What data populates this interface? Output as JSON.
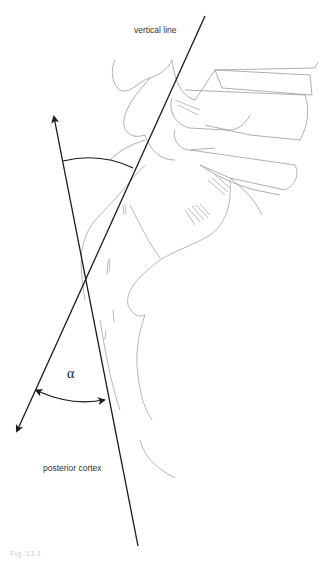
{
  "figure": {
    "labels": {
      "vertical_line": "vertical line",
      "posterior_cortex": "posterior cortex",
      "angle_symbol": "α",
      "caption": "Fig. 13.1"
    },
    "colors": {
      "line": "#1a1a1a",
      "sketch": "#9a9a9a",
      "sketch_dark": "#6e6e6e",
      "background": "#ffffff"
    },
    "geometry": {
      "vertical_line": {
        "x1": 205,
        "y1": 16,
        "x2": 15,
        "y2": 435,
        "arrow_end": "bottom-left"
      },
      "posterior_cortex_line": {
        "x1": 53,
        "y1": 113,
        "x2": 138,
        "y2": 546,
        "arrow_end": "top"
      },
      "intersection": {
        "x": 85,
        "y": 283
      },
      "upper_arc": {
        "from": [
          63,
          161
        ],
        "to": [
          133,
          168
        ]
      },
      "lower_arc": {
        "from": [
          36,
          391
        ],
        "to": [
          108,
          400
        ],
        "arrows": "both"
      }
    }
  }
}
